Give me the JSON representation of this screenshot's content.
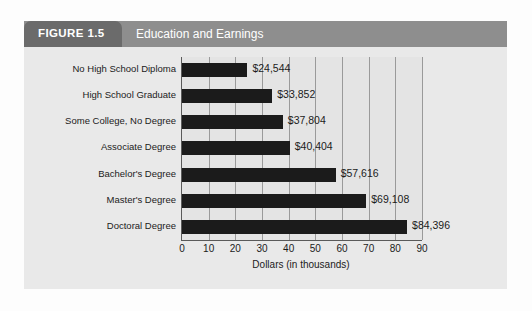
{
  "figure": {
    "tab_label": "FIGURE 1.5",
    "title": "Education and Earnings"
  },
  "colors": {
    "tab": "#6b6b6b",
    "header_band": "#8e8e8e",
    "card_background": "#e9e9e9",
    "plot_background": "#e4e4e4",
    "bar": "#1b1b1b",
    "gridline": "#9a9a9a",
    "axis": "#5a5a5a",
    "header_text": "#ffffff",
    "body_text": "#1b1b1b"
  },
  "chart_data": {
    "type": "bar",
    "orientation": "horizontal",
    "title": "Education and Earnings",
    "xlabel": "Dollars (in thousands)",
    "ylabel": "",
    "xlim": [
      0,
      90
    ],
    "xticks": [
      0,
      10,
      20,
      30,
      40,
      50,
      60,
      70,
      80,
      90
    ],
    "xtick_labels": [
      "0",
      "10",
      "20",
      "30",
      "40",
      "50",
      "60",
      "70",
      "80",
      "90"
    ],
    "grid": true,
    "legend": null,
    "categories": [
      "No High School Diploma",
      "High School Graduate",
      "Some College, No Degree",
      "Associate Degree",
      "Bachelor's Degree",
      "Master's Degree",
      "Doctoral Degree"
    ],
    "values": [
      24.544,
      33.852,
      37.804,
      40.404,
      57.616,
      69.108,
      84.396
    ],
    "data_labels": [
      "$24,544",
      "$33,852",
      "$37,804",
      "$40,404",
      "$57,616",
      "$69,108",
      "$84,396"
    ],
    "units": "thousands of dollars"
  }
}
